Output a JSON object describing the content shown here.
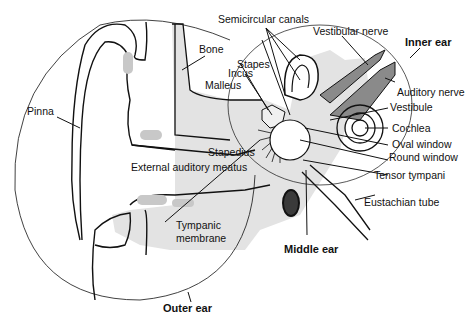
{
  "diagram": {
    "colors": {
      "line": "#111111",
      "bone": "#e3e3e3",
      "nerve": "#8a8a8a",
      "tube_dark": "#3a3a3a",
      "cartilage": "#c8c8c8"
    },
    "regions": {
      "outer_ear": "Outer ear",
      "middle_ear": "Middle ear",
      "inner_ear": "Inner ear"
    },
    "labels": {
      "semicircular_canals": "Semicircular canals",
      "vestibular_nerve": "Vestibular nerve",
      "bone": "Bone",
      "stapes": "Stapes",
      "incus": "Incus",
      "malleus": "Malleus",
      "auditory_nerve": "Auditory nerve",
      "vestibule": "Vestibule",
      "pinna": "Pinna",
      "cochlea": "Cochlea",
      "oval_window": "Oval window",
      "round_window": "Round window",
      "stapedius": "Stapedius",
      "external_auditory_meatus": "External auditory meatus",
      "tensor_tympani": "Tensor tympani",
      "eustachian_tube": "Eustachian tube",
      "tympanic_membrane_1": "Tympanic",
      "tympanic_membrane_2": "membrane"
    }
  }
}
